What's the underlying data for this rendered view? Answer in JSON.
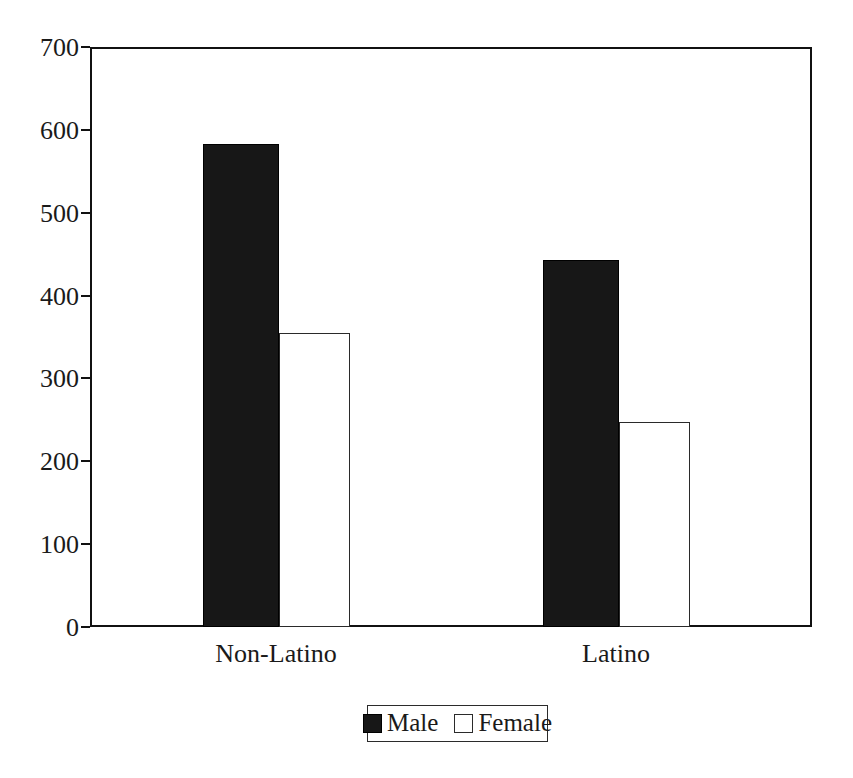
{
  "chart_data": {
    "type": "bar",
    "title": "",
    "subtitle": "",
    "xlabel": "",
    "ylabel": "",
    "categories": [
      "Non-Latino",
      "Latino"
    ],
    "series": [
      {
        "name": "Male",
        "color": "#171717",
        "values": [
          583,
          443
        ]
      },
      {
        "name": "Female",
        "color": "#ffffff",
        "values": [
          355,
          248
        ]
      }
    ],
    "ylim": [
      0,
      700
    ],
    "yticks": [
      0,
      100,
      200,
      300,
      400,
      500,
      600,
      700
    ],
    "ytick_labels": [
      "0",
      "100",
      "200",
      "300",
      "400",
      "500",
      "600",
      "700"
    ],
    "grid": false,
    "legend_position": "bottom",
    "legend_entries": [
      "Male",
      "Female"
    ],
    "frame": "box"
  },
  "axes": {
    "y_ticks": [
      {
        "value": 700,
        "label": "700"
      },
      {
        "value": 600,
        "label": "600"
      },
      {
        "value": 500,
        "label": "500"
      },
      {
        "value": 400,
        "label": "400"
      },
      {
        "value": 300,
        "label": "300"
      },
      {
        "value": 200,
        "label": "200"
      },
      {
        "value": 100,
        "label": "100"
      },
      {
        "value": 0,
        "label": "0"
      }
    ],
    "x_categories": [
      {
        "label": "Non-Latino"
      },
      {
        "label": "Latino"
      }
    ]
  },
  "legend": {
    "items": [
      {
        "label": "Male",
        "swatch": "filled-black-square"
      },
      {
        "label": "Female",
        "swatch": "empty-white-square"
      }
    ]
  },
  "colors": {
    "male_bar": "#171717",
    "female_bar": "#ffffff",
    "outline": "#111111",
    "text": "#1a1a1a",
    "background": "#ffffff"
  }
}
